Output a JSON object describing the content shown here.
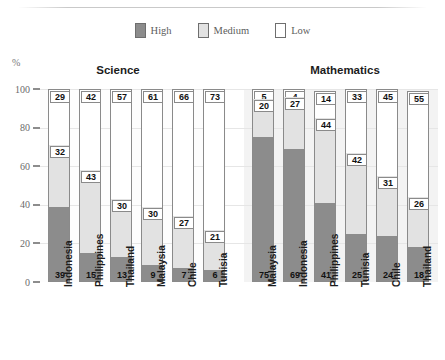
{
  "axis": {
    "y_unit": "%",
    "ticks": [
      100,
      80,
      60,
      40,
      20,
      0
    ]
  },
  "legend": {
    "items": [
      {
        "label": "High",
        "color": "#8c8c8c"
      },
      {
        "label": "Medium",
        "color": "#e2e2e2"
      },
      {
        "label": "Low",
        "color": "#ffffff"
      }
    ]
  },
  "sections": [
    {
      "id": "science",
      "title": "Science"
    },
    {
      "id": "math",
      "title": "Mathematics"
    }
  ],
  "chart_data": {
    "type": "bar",
    "subtype": "stacked-100-percent",
    "title": "",
    "xlabel": "",
    "ylabel": "%",
    "ylim": [
      0,
      100
    ],
    "yticks": [
      0,
      20,
      40,
      60,
      80,
      100
    ],
    "grid": true,
    "legend_position": "top-center",
    "series": [
      {
        "name": "High",
        "color": "#8c8c8c"
      },
      {
        "name": "Medium",
        "color": "#e2e2e2"
      },
      {
        "name": "Low",
        "color": "#ffffff"
      }
    ],
    "groups": [
      {
        "name": "Science",
        "categories": [
          "Indonesia",
          "Philippines",
          "Thailand",
          "Malaysia",
          "Chile",
          "Tunisia"
        ],
        "values": {
          "High": [
            39,
            15,
            13,
            9,
            7,
            6
          ],
          "Medium": [
            32,
            43,
            30,
            30,
            27,
            21
          ],
          "Low": [
            29,
            42,
            57,
            61,
            66,
            73
          ]
        }
      },
      {
        "name": "Mathematics",
        "categories": [
          "Malaysia",
          "Indonesia",
          "Philippines",
          "Tunisia",
          "Chile",
          "Thailand"
        ],
        "values": {
          "High": [
            75,
            69,
            41,
            25,
            24,
            18
          ],
          "Medium": [
            20,
            27,
            44,
            42,
            31,
            26
          ],
          "Low": [
            5,
            4,
            14,
            33,
            45,
            55
          ]
        }
      }
    ]
  }
}
